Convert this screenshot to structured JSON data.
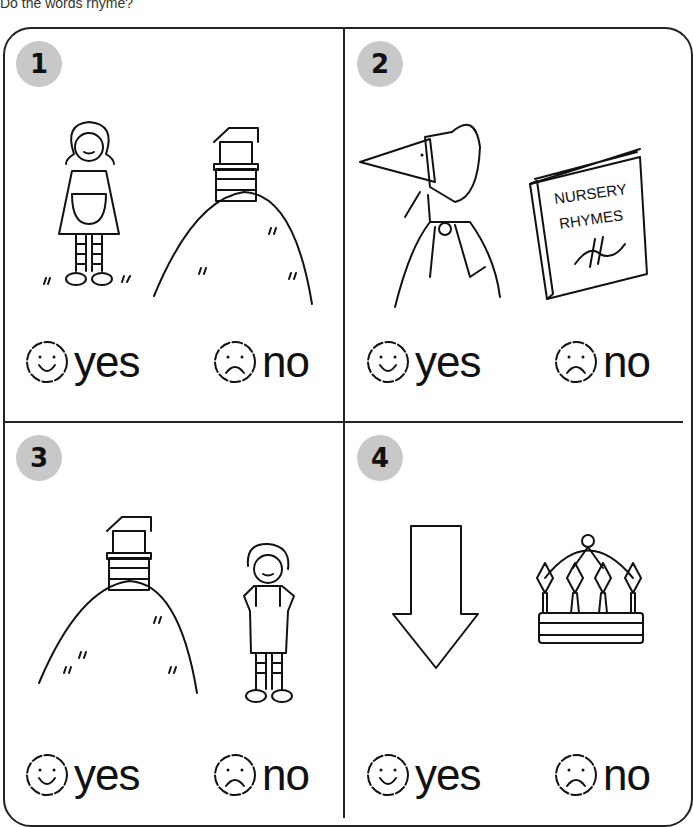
{
  "worksheet": {
    "title": "Do the words rhyme?",
    "panels": [
      {
        "number": "1",
        "pictures": [
          "girl (Jill)",
          "hill with well"
        ],
        "options": {
          "yes": "yes",
          "no": "no"
        }
      },
      {
        "number": "2",
        "pictures": [
          "Bo-Peep bonnet",
          "Nursery Rhymes book"
        ],
        "book_text": [
          "NURSERY",
          "RHYMES"
        ],
        "options": {
          "yes": "yes",
          "no": "no"
        }
      },
      {
        "number": "3",
        "pictures": [
          "hill with well",
          "boy (Jack)"
        ],
        "options": {
          "yes": "yes",
          "no": "no"
        }
      },
      {
        "number": "4",
        "pictures": [
          "down arrow",
          "crown"
        ],
        "options": {
          "yes": "yes",
          "no": "no"
        }
      }
    ],
    "colors": {
      "badge": "#c8c8c8",
      "ink": "#111111",
      "background": "#ffffff"
    }
  }
}
